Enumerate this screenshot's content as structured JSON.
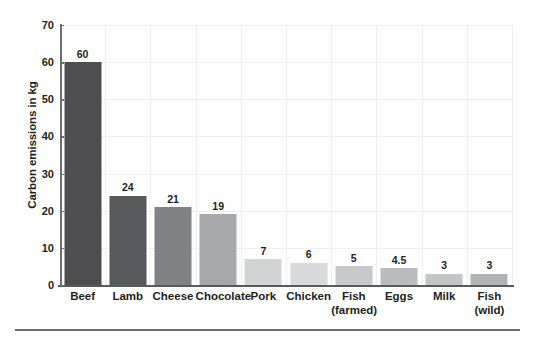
{
  "chart_data": {
    "type": "bar",
    "title": "",
    "subtitle": "",
    "xlabel": "",
    "ylabel": "Carbon emissions in kg",
    "ylim": [
      0,
      70
    ],
    "yticks": [
      0,
      10,
      20,
      30,
      40,
      50,
      60,
      70
    ],
    "ytick_labels": [
      "0",
      "10",
      "20",
      "30",
      "40",
      "50",
      "60",
      "70"
    ],
    "grid": "faint",
    "legend": "none",
    "categories": [
      "Beef",
      "Lamb",
      "Cheese",
      "Chocolate",
      "Pork",
      "Chicken",
      "Fish (farmed)",
      "Eggs",
      "Milk",
      "Fish (wild)"
    ],
    "category_lines": [
      [
        "Beef",
        ""
      ],
      [
        "Lamb",
        ""
      ],
      [
        "Cheese",
        ""
      ],
      [
        "Chocolate",
        ""
      ],
      [
        "Pork",
        ""
      ],
      [
        "Chicken",
        ""
      ],
      [
        "Fish",
        "(farmed)"
      ],
      [
        "Eggs",
        ""
      ],
      [
        "Milk",
        ""
      ],
      [
        "Fish",
        "(wild)"
      ]
    ],
    "values": [
      60,
      24,
      21,
      19,
      7,
      6,
      5,
      4.5,
      3,
      3
    ],
    "value_labels": [
      "60",
      "24",
      "21",
      "19",
      "7",
      "6",
      "5",
      "4.5",
      "3",
      "3"
    ],
    "bar_colors": [
      "#4d4d4f",
      "#58595b",
      "#808285",
      "#a7a9ac",
      "#d1d3d4",
      "#d8dadb",
      "#c7c9cb",
      "#b9bbbd",
      "#c2c4c6",
      "#b1b3b5"
    ]
  },
  "colors": {
    "axis": "#6d6e71",
    "grid": "#f0f0f1",
    "text": "#231f20",
    "rule": "#6d6e71",
    "background": "#ffffff"
  }
}
